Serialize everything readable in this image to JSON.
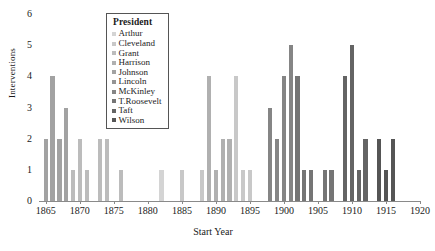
{
  "chart_data": {
    "type": "bar",
    "title": "",
    "xlabel": "Start Year",
    "ylabel": "Interventions",
    "xlim": [
      1864,
      1920
    ],
    "ylim": [
      0,
      6
    ],
    "yticks": [
      0,
      1,
      2,
      3,
      4,
      5,
      6
    ],
    "xticks": [
      1865,
      1870,
      1875,
      1880,
      1885,
      1890,
      1895,
      1900,
      1905,
      1910,
      1915,
      1920
    ],
    "grid": false,
    "legend_position": "upper-center",
    "legend_title": "President",
    "series": [
      {
        "name": "Arthur",
        "color": "#d4d4d4"
      },
      {
        "name": "Cleveland",
        "color": "#c8c8c8"
      },
      {
        "name": "Grant",
        "color": "#bcbcbc"
      },
      {
        "name": "Harrison",
        "color": "#b0b0b0"
      },
      {
        "name": "Johnson",
        "color": "#a2a2a2"
      },
      {
        "name": "Lincoln",
        "color": "#949494"
      },
      {
        "name": "McKinley",
        "color": "#858585"
      },
      {
        "name": "T.Roosevelt",
        "color": "#757575"
      },
      {
        "name": "Taft",
        "color": "#646464"
      },
      {
        "name": "Wilson",
        "color": "#555555"
      }
    ],
    "bars": [
      {
        "x": 1865,
        "value": 2,
        "president": "Johnson"
      },
      {
        "x": 1866,
        "value": 4,
        "president": "Johnson"
      },
      {
        "x": 1867,
        "value": 2,
        "president": "Johnson"
      },
      {
        "x": 1868,
        "value": 3,
        "president": "Johnson"
      },
      {
        "x": 1869,
        "value": 1,
        "president": "Grant"
      },
      {
        "x": 1870,
        "value": 2,
        "president": "Grant"
      },
      {
        "x": 1871,
        "value": 1,
        "president": "Grant"
      },
      {
        "x": 1873,
        "value": 2,
        "president": "Grant"
      },
      {
        "x": 1874,
        "value": 2,
        "president": "Grant"
      },
      {
        "x": 1876,
        "value": 1,
        "president": "Grant"
      },
      {
        "x": 1882,
        "value": 1,
        "president": "Arthur"
      },
      {
        "x": 1885,
        "value": 1,
        "president": "Cleveland"
      },
      {
        "x": 1888,
        "value": 1,
        "president": "Cleveland"
      },
      {
        "x": 1889,
        "value": 4,
        "president": "Harrison"
      },
      {
        "x": 1890,
        "value": 1,
        "president": "Harrison"
      },
      {
        "x": 1891,
        "value": 2,
        "president": "Harrison"
      },
      {
        "x": 1892,
        "value": 2,
        "president": "Harrison"
      },
      {
        "x": 1893,
        "value": 4,
        "president": "Cleveland"
      },
      {
        "x": 1894,
        "value": 1,
        "president": "Cleveland"
      },
      {
        "x": 1895,
        "value": 1,
        "president": "Cleveland"
      },
      {
        "x": 1898,
        "value": 3,
        "president": "McKinley"
      },
      {
        "x": 1899,
        "value": 2,
        "president": "McKinley"
      },
      {
        "x": 1900,
        "value": 4,
        "president": "McKinley"
      },
      {
        "x": 1901,
        "value": 5,
        "president": "McKinley"
      },
      {
        "x": 1902,
        "value": 4,
        "president": "T.Roosevelt"
      },
      {
        "x": 1903,
        "value": 1,
        "president": "T.Roosevelt"
      },
      {
        "x": 1904,
        "value": 1,
        "president": "T.Roosevelt"
      },
      {
        "x": 1906,
        "value": 1,
        "president": "T.Roosevelt"
      },
      {
        "x": 1907,
        "value": 1,
        "president": "T.Roosevelt"
      },
      {
        "x": 1909,
        "value": 4,
        "president": "Taft"
      },
      {
        "x": 1910,
        "value": 5,
        "president": "Taft"
      },
      {
        "x": 1911,
        "value": 1,
        "president": "Taft"
      },
      {
        "x": 1912,
        "value": 2,
        "president": "Taft"
      },
      {
        "x": 1914,
        "value": 2,
        "president": "Wilson"
      },
      {
        "x": 1915,
        "value": 1,
        "president": "Wilson"
      },
      {
        "x": 1916,
        "value": 2,
        "president": "Wilson"
      }
    ]
  }
}
